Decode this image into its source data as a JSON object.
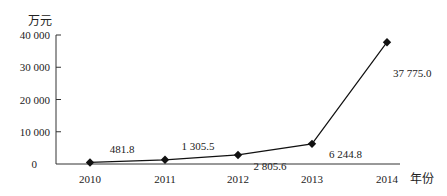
{
  "chart_data": {
    "type": "line",
    "title": "",
    "xlabel": "年份",
    "ylabel": "万元",
    "categories": [
      "2010",
      "2011",
      "2012",
      "2013",
      "2014"
    ],
    "series": [
      {
        "name": "",
        "values": [
          481.8,
          1305.5,
          2805.6,
          6244.8,
          37775.0
        ]
      }
    ],
    "data_labels": [
      "481.8",
      "1 305.5",
      "2 805.6",
      "6 244.8",
      "37 775.0"
    ],
    "y_ticks": [
      0,
      10000,
      20000,
      30000,
      40000
    ],
    "y_tick_labels": [
      "0",
      "10 000",
      "20 000",
      "30 000",
      "40 000"
    ],
    "ylim": [
      0,
      40000
    ],
    "grid": false,
    "legend": "none",
    "marker": "diamond",
    "color": "#111111"
  }
}
